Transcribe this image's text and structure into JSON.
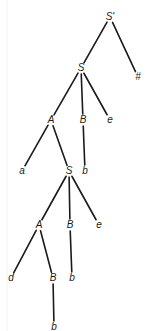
{
  "diagram": {
    "type": "parse-tree",
    "background": "#ffffff",
    "line_color": "#1a1a1a",
    "nodes": [
      {
        "id": "n0",
        "label": "S'",
        "x": 110,
        "y": 17
      },
      {
        "id": "n1",
        "label": "S",
        "x": 81,
        "y": 68
      },
      {
        "id": "n2",
        "label": "#",
        "x": 138,
        "y": 77
      },
      {
        "id": "n3",
        "label": "A",
        "x": 51,
        "y": 120
      },
      {
        "id": "n4",
        "label": "B",
        "x": 83,
        "y": 120
      },
      {
        "id": "n5",
        "label": "e",
        "x": 110,
        "y": 120
      },
      {
        "id": "n6",
        "label": "a",
        "x": 22,
        "y": 171
      },
      {
        "id": "n7",
        "label": "S",
        "x": 69,
        "y": 171
      },
      {
        "id": "n8",
        "label": "b",
        "x": 85,
        "y": 171
      },
      {
        "id": "n9",
        "label": "A",
        "x": 39,
        "y": 225
      },
      {
        "id": "n10",
        "label": "B",
        "x": 70,
        "y": 225
      },
      {
        "id": "n11",
        "label": "e",
        "x": 99,
        "y": 225
      },
      {
        "id": "n12",
        "label": "d",
        "x": 11,
        "y": 278
      },
      {
        "id": "n13",
        "label": "B",
        "x": 53,
        "y": 278
      },
      {
        "id": "n14",
        "label": "b",
        "x": 72,
        "y": 278
      },
      {
        "id": "n15",
        "label": "b",
        "x": 54,
        "y": 327
      }
    ],
    "edges": [
      {
        "from": "n0",
        "to": "n1"
      },
      {
        "from": "n0",
        "to": "n2"
      },
      {
        "from": "n1",
        "to": "n3"
      },
      {
        "from": "n1",
        "to": "n4"
      },
      {
        "from": "n1",
        "to": "n5"
      },
      {
        "from": "n3",
        "to": "n6"
      },
      {
        "from": "n3",
        "to": "n7"
      },
      {
        "from": "n4",
        "to": "n8"
      },
      {
        "from": "n7",
        "to": "n9"
      },
      {
        "from": "n7",
        "to": "n10"
      },
      {
        "from": "n7",
        "to": "n11"
      },
      {
        "from": "n9",
        "to": "n12"
      },
      {
        "from": "n9",
        "to": "n13"
      },
      {
        "from": "n10",
        "to": "n14"
      },
      {
        "from": "n13",
        "to": "n15"
      }
    ]
  }
}
